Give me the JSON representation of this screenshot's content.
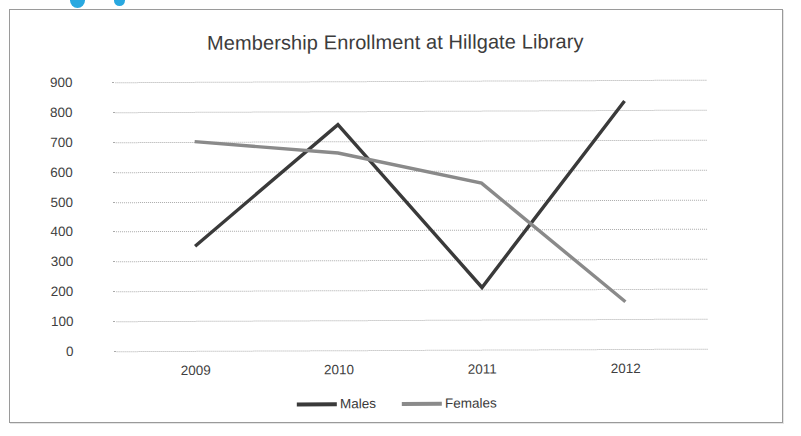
{
  "chart_data": {
    "type": "line",
    "title": "Membership Enrollment at Hillgate Library",
    "xlabel": "",
    "ylabel": "",
    "categories": [
      "2009",
      "2010",
      "2011",
      "2012"
    ],
    "ylim": [
      0,
      900
    ],
    "ytick_step": 100,
    "yticks": [
      "900",
      "800",
      "700",
      "600",
      "500",
      "400",
      "300",
      "200",
      "100",
      "0"
    ],
    "grid": "horizontal-dotted",
    "legend_position": "bottom-center",
    "series": [
      {
        "name": "Males",
        "color": "#3a3a3a",
        "values": [
          350,
          755,
          208,
          830
        ]
      },
      {
        "name": "Females",
        "color": "#8a8a8a",
        "values": [
          700,
          660,
          557,
          158
        ]
      }
    ]
  },
  "artifacts": {
    "dot_color": "#29a8e0"
  }
}
